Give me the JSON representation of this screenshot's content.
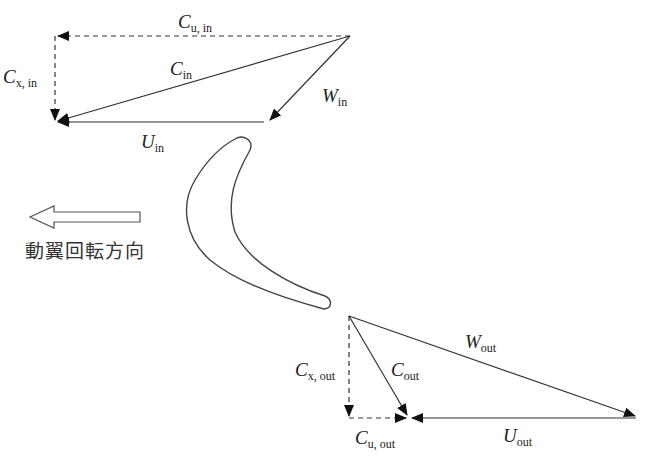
{
  "diagram": {
    "type": "turbine-velocity-triangles",
    "rotation_direction_label": "動翼回転方向",
    "colors": {
      "line": "#333333",
      "arrow": "#111111",
      "background": "#ffffff"
    },
    "inlet_triangle": {
      "labels": {
        "cu": {
          "main": "C",
          "sub": "u, in"
        },
        "cx": {
          "main": "C",
          "sub": "x, in"
        },
        "c": {
          "main": "C",
          "sub": "in"
        },
        "w": {
          "main": "W",
          "sub": "in"
        },
        "u": {
          "main": "U",
          "sub": "in"
        }
      }
    },
    "outlet_triangle": {
      "labels": {
        "cx": {
          "main": "C",
          "sub": "x, out"
        },
        "c": {
          "main": "C",
          "sub": "out"
        },
        "w": {
          "main": "W",
          "sub": "out"
        },
        "cu": {
          "main": "C",
          "sub": "u, out"
        },
        "u": {
          "main": "U",
          "sub": "out"
        }
      }
    }
  }
}
